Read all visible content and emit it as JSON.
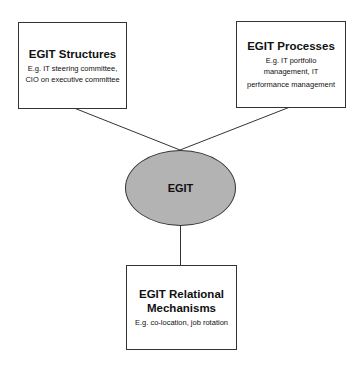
{
  "diagram": {
    "center": {
      "label": "EGIT",
      "fill": "#b3b3b3"
    },
    "nodes": [
      {
        "id": "structures",
        "title": "EGIT Structures",
        "subtitle_lines": [
          "E.g. IT steering committee,",
          "CIO on executive committee"
        ]
      },
      {
        "id": "processes",
        "title": "EGIT Processes",
        "subtitle_lines": [
          "E.g. IT portfolio",
          "management, IT",
          "performance management"
        ]
      },
      {
        "id": "relational",
        "title_lines": [
          "EGIT Relational",
          "Mechanisms"
        ],
        "subtitle_lines": [
          "E.g. co-location, job rotation"
        ]
      }
    ],
    "edges": [
      {
        "from": "structures",
        "to": "EGIT"
      },
      {
        "from": "processes",
        "to": "EGIT"
      },
      {
        "from": "EGIT",
        "to": "relational"
      }
    ]
  }
}
